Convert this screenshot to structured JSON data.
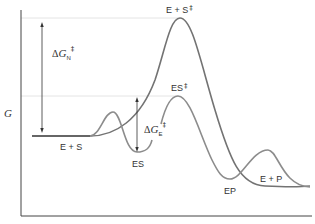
{
  "diagram": {
    "type": "free-energy reaction coordinate",
    "y_axis_label": "G",
    "curves": [
      {
        "name": "uncatalyzed",
        "color": "#7a7a7a"
      },
      {
        "name": "enzyme-catalyzed",
        "color": "#8a8a8a"
      }
    ],
    "labels": {
      "es_start": "E + S",
      "ts_uncat": "E + S",
      "ts_uncat_mark": "‡",
      "es_complex": "ES",
      "ts_cat": "ES",
      "ts_cat_mark": "‡",
      "ep_complex": "EP",
      "ep_end": "E + P"
    },
    "delta_n": {
      "delta": "Δ",
      "var": "G",
      "sub": "N",
      "mark": "‡"
    },
    "delta_e": {
      "delta": "Δ",
      "var": "G",
      "sub": "E",
      "mark": "‡"
    },
    "guide_color": "#e6e6e6",
    "axis_color": "#444444"
  }
}
